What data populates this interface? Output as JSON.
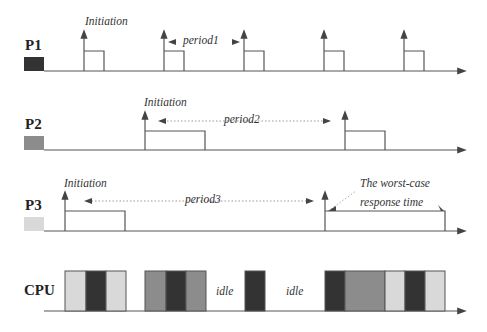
{
  "rows": [
    {
      "id": "P1",
      "label": "P1",
      "swatch": "#333333"
    },
    {
      "id": "P2",
      "label": "P2",
      "swatch": "#8c8c8c"
    },
    {
      "id": "P3",
      "label": "P3",
      "swatch": "#d9d9d9"
    },
    {
      "id": "CPU",
      "label": "CPU"
    }
  ],
  "annotations": {
    "p1_initiation": "Initiation",
    "p1_period": "period1",
    "p2_initiation": "Initiation",
    "p2_period": "period2",
    "p3_initiation": "Initiation",
    "p3_period": "period3",
    "worst_case_line1": "The worst-case",
    "worst_case_line2": "response time",
    "idle1": "idle",
    "idle2": "idle"
  },
  "colors": {
    "P1": "#333333",
    "P2": "#8c8c8c",
    "P3": "#d9d9d9",
    "line": "#555555"
  },
  "schedule": {
    "P1_releases": [
      84,
      164,
      244,
      324,
      404
    ],
    "P2_releases": [
      145,
      345
    ],
    "P3_releases": [
      65,
      325
    ],
    "cpu_segments": [
      {
        "task": "P3",
        "x0": 65,
        "x1": 86
      },
      {
        "task": "P1",
        "x0": 86,
        "x1": 106
      },
      {
        "task": "P3",
        "x0": 106,
        "x1": 126
      },
      {
        "task": "P2",
        "x0": 145,
        "x1": 166
      },
      {
        "task": "P1",
        "x0": 166,
        "x1": 186
      },
      {
        "task": "P2",
        "x0": 186,
        "x1": 206
      },
      {
        "task": "P1",
        "x0": 245,
        "x1": 265
      },
      {
        "task": "P1",
        "x0": 325,
        "x1": 345
      },
      {
        "task": "P2",
        "x0": 345,
        "x1": 385
      },
      {
        "task": "P3",
        "x0": 385,
        "x1": 405
      },
      {
        "task": "P1",
        "x0": 405,
        "x1": 425
      },
      {
        "task": "P3",
        "x0": 425,
        "x1": 445
      }
    ]
  }
}
